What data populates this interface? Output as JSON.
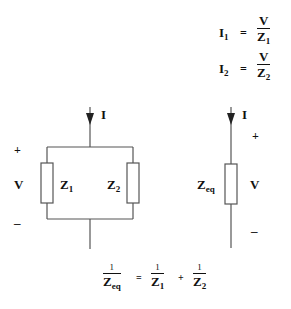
{
  "equations": {
    "i1": {
      "lhs": "I",
      "lhs_sub": "1",
      "eq": "=",
      "num": "V",
      "den": "Z",
      "den_sub": "1"
    },
    "i2": {
      "lhs": "I",
      "lhs_sub": "2",
      "eq": "=",
      "num": "V",
      "den": "Z",
      "den_sub": "2"
    },
    "zeq": {
      "t1_num": "1",
      "t1_den": "Z",
      "t1_sub": "eq",
      "eq": "=",
      "t2_num": "1",
      "t2_den": "Z",
      "t2_sub": "1",
      "plus": "+",
      "t3_num": "1",
      "t3_den": "Z",
      "t3_sub": "2"
    }
  },
  "parallel_circuit": {
    "current": "I",
    "plus": "+",
    "voltage": "V",
    "minus": "–",
    "z1": "Z",
    "z1_sub": "1",
    "z2": "Z",
    "z2_sub": "2"
  },
  "equivalent_circuit": {
    "current": "I",
    "plus": "+",
    "voltage": "V",
    "minus": "–",
    "zeq": "Z",
    "zeq_sub": "eq"
  },
  "colors": {
    "line": "#555555",
    "text": "#111111",
    "background": "#ffffff"
  }
}
